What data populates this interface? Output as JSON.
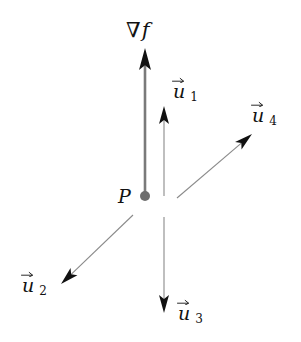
{
  "figure": {
    "background_color": "#ffffff",
    "width": 301,
    "height": 342
  },
  "point": {
    "label": "P",
    "dot_color": "#6e6e6e",
    "label_color": "#121212",
    "x": 145,
    "y": 196,
    "radius": 5,
    "label_x": 118,
    "label_y": 187
  },
  "gradient": {
    "label_nabla": "∇",
    "label_function": "f",
    "label_x": 126,
    "label_y": 20,
    "shaft_color": "#7a7a7a",
    "head_color": "#111111",
    "from_x": 145,
    "from_y": 196,
    "to_x": 145,
    "to_y": 48,
    "shaft_width": 2.6,
    "head_length": 22,
    "head_half_width": 6
  },
  "vectors": [
    {
      "name": "u1",
      "base": "u",
      "subscript": "1",
      "label_x": 173,
      "label_y": 82,
      "shaft_color": "#8a8a8a",
      "head_color": "#111111",
      "from_x": 164,
      "from_y": 196,
      "to_x": 164,
      "to_y": 106,
      "shaft_width": 1.1,
      "head_length": 18,
      "head_half_width": 5
    },
    {
      "name": "u2",
      "base": "u",
      "subscript": "2",
      "label_x": 22,
      "label_y": 276,
      "shaft_color": "#8a8a8a",
      "head_color": "#111111",
      "from_x": 133,
      "from_y": 215,
      "to_x": 61,
      "to_y": 284,
      "shaft_width": 1.1,
      "head_length": 18,
      "head_half_width": 5
    },
    {
      "name": "u3",
      "base": "u",
      "subscript": "3",
      "label_x": 178,
      "label_y": 304,
      "shaft_color": "#8a8a8a",
      "head_color": "#111111",
      "from_x": 164,
      "from_y": 217,
      "to_x": 164,
      "to_y": 313,
      "shaft_width": 1.1,
      "head_length": 18,
      "head_half_width": 5
    },
    {
      "name": "u4",
      "base": "u",
      "subscript": "4",
      "label_x": 252,
      "label_y": 106,
      "shaft_color": "#8a8a8a",
      "head_color": "#111111",
      "from_x": 177,
      "from_y": 198,
      "to_x": 252,
      "to_y": 134,
      "shaft_width": 1.1,
      "head_length": 18,
      "head_half_width": 5
    }
  ]
}
